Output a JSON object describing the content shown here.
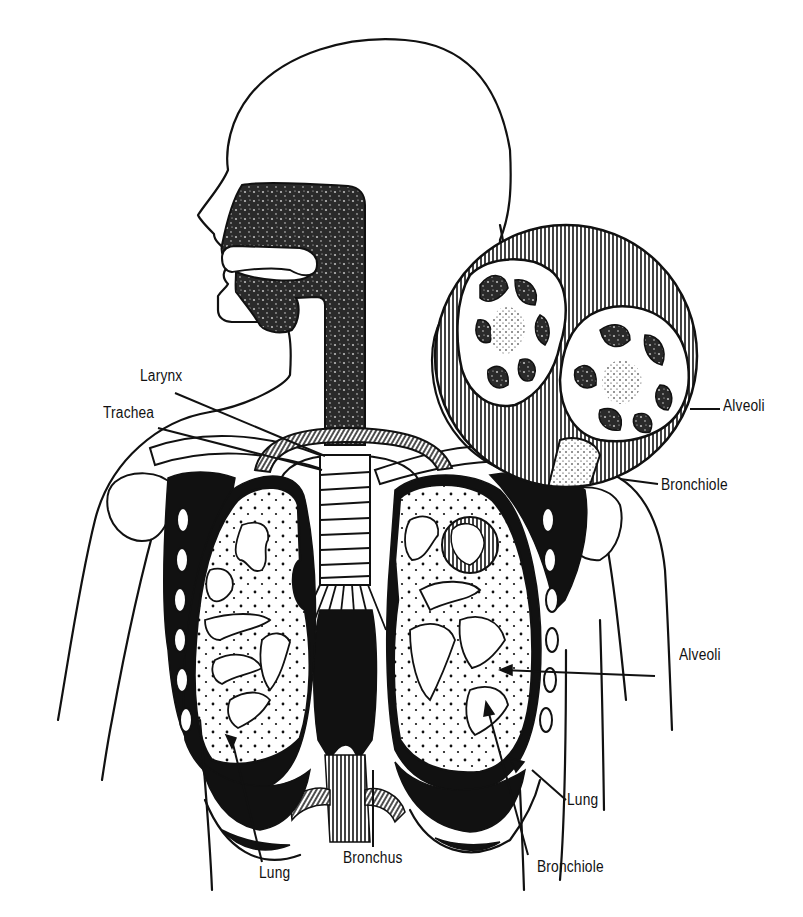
{
  "diagram": {
    "style": "black-and-white anatomical line illustration",
    "colors": {
      "ink": "#111111",
      "background": "#ffffff"
    },
    "labels": [
      {
        "id": "larynx",
        "text": "Larynx",
        "x": 140,
        "y": 368,
        "points_to": "larynx"
      },
      {
        "id": "trachea",
        "text": "Trachea",
        "x": 103,
        "y": 405,
        "points_to": "trachea"
      },
      {
        "id": "alveoli-inset",
        "text": "Alveoli",
        "x": 723,
        "y": 398,
        "points_to": "alveoli (magnified inset)"
      },
      {
        "id": "bronchiole-inset",
        "text": "Bronchiole",
        "x": 661,
        "y": 477,
        "points_to": "bronchiole (magnified inset)"
      },
      {
        "id": "alveoli-lung",
        "text": "Alveoli",
        "x": 679,
        "y": 647,
        "points_to": "alveoli in right-side lung"
      },
      {
        "id": "lung-right",
        "text": "Lung",
        "x": 567,
        "y": 792,
        "points_to": "lung (right side of image)"
      },
      {
        "id": "lung-left",
        "text": "Lung",
        "x": 259,
        "y": 865,
        "points_to": "lung (left side of image)"
      },
      {
        "id": "bronchus",
        "text": "Bronchus",
        "x": 343,
        "y": 850,
        "points_to": "bronchus"
      },
      {
        "id": "bronchiole-lung",
        "text": "Bronchiole",
        "x": 537,
        "y": 859,
        "points_to": "bronchiole in lung"
      }
    ],
    "structures": [
      "head profile",
      "nasal cavity",
      "oral cavity",
      "pharynx",
      "larynx",
      "trachea",
      "clavicles",
      "ribs",
      "left lung",
      "right lung",
      "bronchi",
      "diaphragm",
      "magnified alveoli inset"
    ]
  }
}
